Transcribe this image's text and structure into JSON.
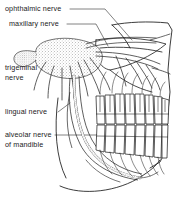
{
  "figure": {
    "type": "anatomical-line-drawing",
    "width": 179,
    "height": 204,
    "background_color": "#ffffff",
    "ink_color": "#1a1a1a",
    "stipple_color": "#6b6b6b"
  },
  "labels": [
    {
      "id": "ophthalmic",
      "lines": [
        "ophthalmic nerve"
      ],
      "leader": "dashed-line-to-upper-nerve-trunk"
    },
    {
      "id": "maxillary",
      "lines": [
        "maxillary nerve"
      ],
      "leader": "dashed-line-to-maxillary-branch"
    },
    {
      "id": "trigeminal",
      "lines": [
        "trigeminal",
        "nerve"
      ],
      "leader": "slash-to-ganglion"
    },
    {
      "id": "lingual",
      "lines": [
        "lingual nerve"
      ],
      "leader": "slash-to-lingual-branch"
    },
    {
      "id": "alveolar",
      "lines": [
        "alveolar nerve",
        "of mandible"
      ],
      "leader": "dashed-line-to-inferior-alveolar-canal"
    }
  ],
  "anatomy": {
    "structures": [
      "trigeminal ganglion",
      "ophthalmic nerve",
      "maxillary nerve",
      "mandibular nerve",
      "lingual nerve",
      "inferior alveolar nerve",
      "maxilla with upper teeth",
      "mandible with lower teeth"
    ],
    "upper_teeth_count": 8,
    "lower_teeth_count": 8
  }
}
